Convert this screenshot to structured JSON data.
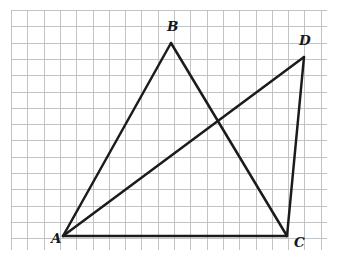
{
  "figure": {
    "canvas": {
      "width": 340,
      "height": 258,
      "background": "#ffffff"
    },
    "grid": {
      "visible": true,
      "color": "#b9bdc2",
      "spacing": 16.3,
      "x_start": 11,
      "y_start": 10,
      "x_end": 327,
      "y_end": 250,
      "columns": 20,
      "rows": 15
    },
    "stroke_color": "#1b1b1b",
    "stroke_width": 2.5,
    "points": [
      {
        "id": "A",
        "label": "A",
        "x": 63,
        "y": 236,
        "label_x": 51,
        "label_y": 243
      },
      {
        "id": "B",
        "label": "B",
        "x": 171,
        "y": 43,
        "label_x": 167,
        "label_y": 31
      },
      {
        "id": "C",
        "label": "C",
        "x": 287,
        "y": 236,
        "label_x": 294,
        "label_y": 247
      },
      {
        "id": "D",
        "label": "D",
        "x": 304,
        "y": 57,
        "label_x": 299,
        "label_y": 45
      }
    ],
    "segments": [
      {
        "name": "segment-AB",
        "from": "A",
        "to": "B",
        "x1": 63,
        "y1": 236,
        "x2": 171,
        "y2": 43
      },
      {
        "name": "segment-BC",
        "from": "B",
        "to": "C",
        "x1": 171,
        "y1": 43,
        "x2": 287,
        "y2": 236
      },
      {
        "name": "segment-AC",
        "from": "A",
        "to": "C",
        "x1": 63,
        "y1": 236,
        "x2": 287,
        "y2": 236
      },
      {
        "name": "segment-AD",
        "from": "A",
        "to": "D",
        "x1": 63,
        "y1": 236,
        "x2": 304,
        "y2": 57
      },
      {
        "name": "segment-DC",
        "from": "D",
        "to": "C",
        "x1": 304,
        "y1": 57,
        "x2": 287,
        "y2": 236
      }
    ],
    "intersection": {
      "name": "segment-crossing-BC-AD",
      "x": 216,
      "y": 120
    }
  }
}
